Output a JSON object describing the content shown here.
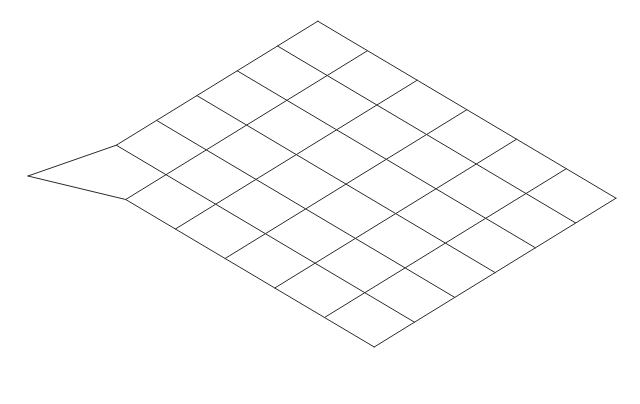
{
  "figure": {
    "background_color": "#ffffff",
    "line_color": "#2b2b2b",
    "line_width": 1,
    "canvas": {
      "width": 640,
      "height": 404
    }
  },
  "chart_data": {
    "type": "line",
    "subtitle": "",
    "xlabel": "",
    "ylabel": "",
    "grid": true,
    "legend": "none",
    "xlim": [
      0,
      640
    ],
    "ylim": [
      0,
      404
    ],
    "mesh": {
      "rows": 6,
      "cols": 6,
      "vertex_rows": 7,
      "vertex_cols": 7,
      "quad_count": 36,
      "projection": "oblique",
      "corners": {
        "top": [
          318,
          21
        ],
        "right": [
          614,
          198
        ],
        "bottom": [
          322,
          375
        ],
        "left": [
          28,
          176
        ]
      },
      "basis": {
        "origin_left_regular": [
          76,
          170
        ],
        "u_step": [
          40.3,
          -24.8
        ],
        "v_step": [
          49.7,
          29.5
        ]
      },
      "displaced_vertices": [
        {
          "row": 0,
          "col": 0,
          "from": [
            76,
            170
          ],
          "to": [
            28,
            176
          ]
        }
      ],
      "edge_segment_counts": {
        "top_left": 6,
        "top_right": 6,
        "bottom_right": 6,
        "bottom_left": 6
      },
      "boundary_vertices": {
        "top_left_edge": [
          [
            28,
            176
          ],
          [
            78,
            169
          ],
          [
            128,
            140
          ],
          [
            177,
            111
          ],
          [
            227,
            82
          ],
          [
            271,
            51
          ],
          [
            318,
            21
          ]
        ],
        "top_right_edge": [
          [
            318,
            21
          ],
          [
            368,
            50
          ],
          [
            417,
            79
          ],
          [
            467,
            108
          ],
          [
            516,
            137
          ],
          [
            565,
            167
          ],
          [
            614,
            198
          ]
        ],
        "bottom_right_edge": [
          [
            614,
            198
          ],
          [
            565,
            227
          ],
          [
            516,
            257
          ],
          [
            467,
            286
          ],
          [
            417,
            316
          ],
          [
            368,
            345
          ],
          [
            322,
            375
          ]
        ],
        "bottom_left_edge": [
          [
            322,
            375
          ],
          [
            275,
            345
          ],
          [
            226,
            316
          ],
          [
            177,
            287
          ],
          [
            129,
            257
          ],
          [
            80,
            227
          ],
          [
            28,
            176
          ]
        ]
      }
    }
  }
}
